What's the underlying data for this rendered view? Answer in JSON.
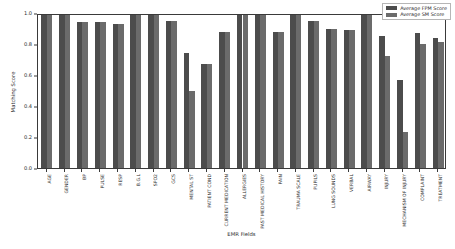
{
  "chart_data": {
    "type": "bar",
    "title": "",
    "xlabel": "EMR Fields",
    "ylabel": "Matching Score",
    "ylim": [
      0.0,
      1.0
    ],
    "yticks": [
      "0.0",
      "0.2",
      "0.4",
      "0.6",
      "0.8",
      "1.0"
    ],
    "grid": false,
    "legend_position": "upper right",
    "categories": [
      "AGE",
      "GENDER",
      "BP",
      "PULSE",
      "RESP",
      "B.G.L",
      "SPO2",
      "GCS",
      "MENTAL ST",
      "PATIENT COND",
      "CURRENT MEDICATION",
      "ALLERGIES",
      "PAST MEDICAL HISTORY",
      "PAIN",
      "TRAUMA SCALE",
      "PUPILS",
      "LUNG SOUNDS",
      "VERBAL",
      "AIRWAY",
      "INJURY",
      "MECHANISM OF INJURY",
      "COMPLAINT",
      "TREATMENT"
    ],
    "series": [
      {
        "name": "Average FPM Score",
        "color": "#4c4c4c",
        "values": [
          1.0,
          1.0,
          0.94,
          0.94,
          0.93,
          1.0,
          1.0,
          0.95,
          0.74,
          0.67,
          0.88,
          1.0,
          1.0,
          0.88,
          1.0,
          0.95,
          0.9,
          0.89,
          1.0,
          0.85,
          0.57,
          0.87,
          0.84
        ]
      },
      {
        "name": "Average SM Score",
        "color": "#6b6b6b",
        "values": [
          1.0,
          1.0,
          0.94,
          0.94,
          0.93,
          1.0,
          1.0,
          0.95,
          0.5,
          0.67,
          0.88,
          1.0,
          1.0,
          0.88,
          1.0,
          0.95,
          0.9,
          0.89,
          1.0,
          0.72,
          0.23,
          0.8,
          0.81
        ]
      }
    ]
  },
  "legend": {
    "items": [
      {
        "label": "Average FPM Score"
      },
      {
        "label": "Average SM Score"
      }
    ]
  },
  "axes": {
    "y_label": "Matching Score",
    "x_label": "EMR Fields"
  }
}
